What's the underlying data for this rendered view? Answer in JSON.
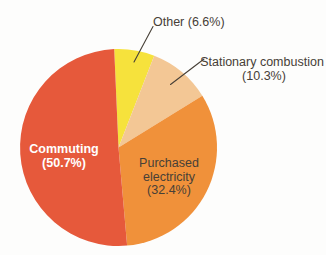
{
  "figure": {
    "background_color": "#fdfdfc",
    "label_text_color": "#474037",
    "inside_left_label_text_color": "#ffffff",
    "leader_line_color": "#474037"
  },
  "chart_data": {
    "type": "pie",
    "title": "",
    "start_angle_deg": -2.5,
    "direction": "clockwise",
    "total_pct": 100.0,
    "legend": "none",
    "slices": [
      {
        "label": "Other",
        "value_pct": 6.6,
        "color": "#f6e23c",
        "label_placement": "outside-callout",
        "display_lines": [
          "Other (6.6%)"
        ]
      },
      {
        "label": "Stationary combustion",
        "value_pct": 10.3,
        "color": "#f3c795",
        "label_placement": "outside-callout",
        "display_lines": [
          "Stationary combustion",
          "(10.3%)"
        ]
      },
      {
        "label": "Purchased electricity",
        "value_pct": 32.4,
        "color": "#f0913a",
        "label_placement": "inside",
        "display_lines": [
          "Purchased",
          "electricity",
          "(32.4%)"
        ]
      },
      {
        "label": "Commuting",
        "value_pct": 50.7,
        "color": "#e6593b",
        "label_placement": "inside",
        "display_lines": [
          "Commuting",
          "(50.7%)"
        ]
      }
    ]
  }
}
